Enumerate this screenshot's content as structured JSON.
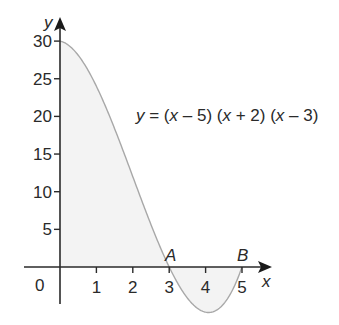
{
  "chart_data": {
    "type": "line",
    "title": "",
    "equation": "y = (x - 5) (x + 2) (x - 3)",
    "equation_parts": {
      "y": "y",
      "eq": " = (",
      "x1": "x",
      "p1": " – 5) (",
      "x2": "x",
      "p2": " + 2) (",
      "x3": "x",
      "p3": " – 3)"
    },
    "xlabel": "x",
    "ylabel": "y",
    "x_ticks": [
      1,
      2,
      3,
      4,
      5
    ],
    "y_ticks": [
      5,
      10,
      15,
      20,
      25,
      30
    ],
    "origin_label": "0",
    "xlim": [
      0,
      5.5
    ],
    "ylim": [
      -6.1,
      30
    ],
    "grid": false,
    "shaded_region": "area between curve and x-axis from x=0 to x=5",
    "points": [
      {
        "label": "A",
        "x": 3,
        "y": 0
      },
      {
        "label": "B",
        "x": 5,
        "y": 0
      }
    ],
    "x": [
      0,
      0.5,
      1,
      1.5,
      2,
      2.5,
      3,
      3.5,
      4,
      4.5,
      5
    ],
    "values": [
      30,
      28.125,
      24,
      18.375,
      12,
      5.625,
      0,
      -4.125,
      -6,
      -4.875,
      0
    ]
  },
  "colors": {
    "axis": "#2a2a2a",
    "curve": "#a8a8a8",
    "shade": "#f3f3f3",
    "text": "#2a2a2a"
  }
}
